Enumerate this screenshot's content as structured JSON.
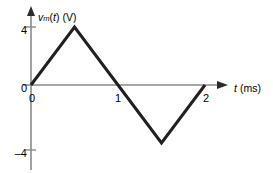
{
  "figure": {
    "kind": "line-plot",
    "background_color": "#ffffff",
    "axis_color": "#8a8a8a",
    "curve_color": "#231f20",
    "text_color": "#1a1a1a"
  },
  "axes": {
    "y": {
      "title_prefix": "v",
      "title_subscript": "m",
      "title_arg_open": "(",
      "title_arg": "t",
      "title_arg_close": ")",
      "title_unit": "(V)",
      "title_full": "vm(t) (V)",
      "tick_labels": [
        "4",
        "0",
        "–4"
      ],
      "tick_values": [
        4,
        0,
        -4
      ]
    },
    "x": {
      "title_symbol": "t",
      "title_unit": "(ms)",
      "title_full": "t (ms)",
      "tick_labels": [
        "0",
        "1",
        "2"
      ],
      "tick_values": [
        0,
        1,
        2
      ]
    }
  },
  "chart_data": {
    "type": "line",
    "title": "",
    "subtitle": "",
    "xlabel": "t (ms)",
    "ylabel": "vm(t) (V)",
    "xlim": [
      0,
      2.2
    ],
    "ylim": [
      -4.6,
      4.6
    ],
    "xticks": [
      0,
      1,
      2
    ],
    "xticklabels": [
      "0",
      "1",
      "2"
    ],
    "yticks": [
      -4,
      0,
      4
    ],
    "yticklabels": [
      "–4",
      "0",
      "4"
    ],
    "grid": false,
    "legend": null,
    "legend_position": "none",
    "annotations": [],
    "series": [
      {
        "name": "vm(t)",
        "color": "#231f20",
        "x": [
          0,
          0.5,
          1,
          1.5,
          2
        ],
        "y": [
          0,
          4,
          0,
          -4,
          0
        ]
      }
    ]
  }
}
